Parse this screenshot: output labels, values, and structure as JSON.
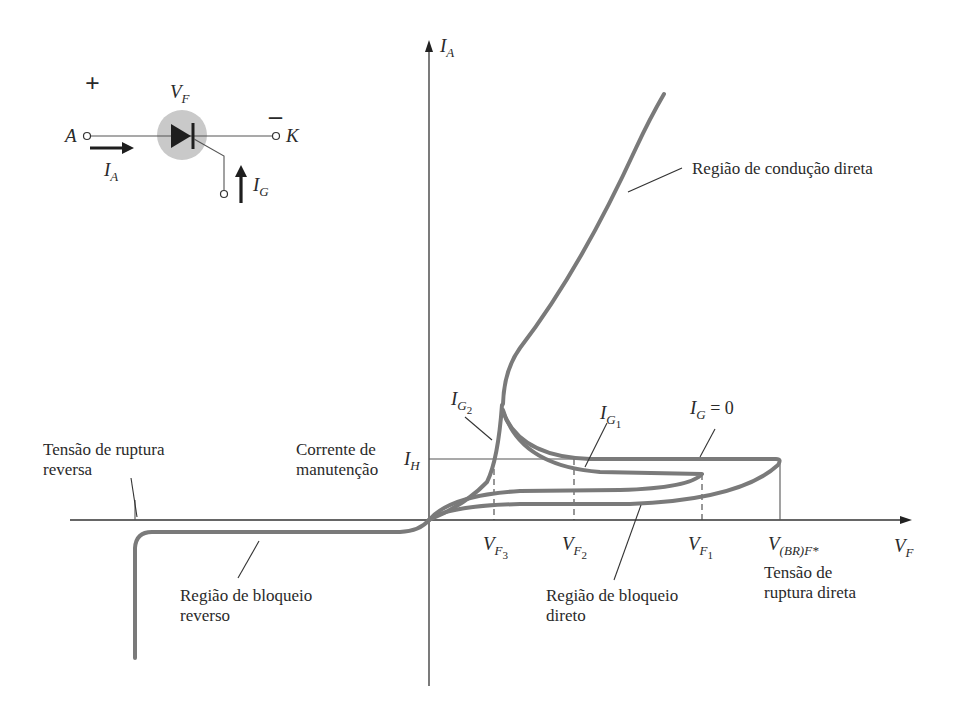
{
  "figure": {
    "type": "scr_characteristic_diagram",
    "background": "#ffffff",
    "curve_color": "#7a7a7a",
    "axis_color": "#333333"
  },
  "axes": {
    "y_label": "I",
    "y_label_sub": "A",
    "x_label": "V",
    "x_label_sub": "F"
  },
  "circuit": {
    "voltage_label": "V",
    "voltage_label_sub": "F",
    "plus_sign": "+",
    "minus_sign": "–",
    "anode_label": "A",
    "cathode_label": "K",
    "anode_current_label": "I",
    "anode_current_sub": "A",
    "gate_current_label": "I",
    "gate_current_sub": "G"
  },
  "curve_labels": {
    "ig2": {
      "main": "I",
      "sub": "G",
      "subsub": "2"
    },
    "ig1": {
      "main": "I",
      "sub": "G",
      "subsub": "1"
    },
    "ig0": {
      "main": "I",
      "sub": "G",
      "rest": " = 0"
    },
    "ih": {
      "main": "I",
      "sub": "H"
    }
  },
  "x_ticks": [
    {
      "main": "V",
      "sub": "F",
      "subsub": "3"
    },
    {
      "main": "V",
      "sub": "F",
      "subsub": "2"
    },
    {
      "main": "V",
      "sub": "F",
      "subsub": "1"
    },
    {
      "main": "V",
      "sub": "(BR)F*"
    }
  ],
  "annotations": {
    "forward_conduction": "Região de condução direta",
    "holding_current_line1": "Corrente de",
    "holding_current_line2": "manutenção",
    "reverse_breakdown_line1": "Tensão de ruptura",
    "reverse_breakdown_line2": "reversa",
    "reverse_blocking_line1": "Região de bloqueio",
    "reverse_blocking_line2": "reverso",
    "forward_blocking_line1": "Região de bloqueio",
    "forward_blocking_line2": "direto",
    "forward_breakdown_line1": "Tensão de",
    "forward_breakdown_line2": "ruptura direta"
  }
}
